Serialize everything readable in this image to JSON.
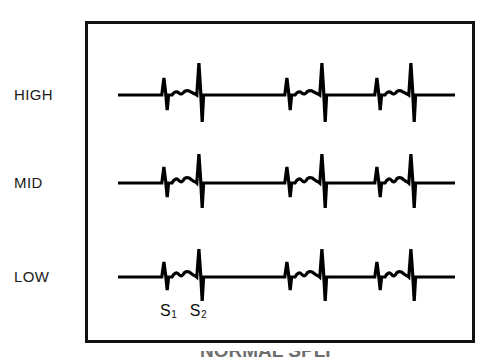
{
  "figure": {
    "background_color": "#ffffff",
    "frame": {
      "border_color": "#111111",
      "border_width_px": 3,
      "x": 85,
      "y": 21,
      "width": 390,
      "height": 322
    },
    "row_labels": [
      {
        "id": "high",
        "label": "HIGH",
        "baseline_y": 95
      },
      {
        "id": "mid",
        "label": "MID",
        "baseline_y": 183
      },
      {
        "id": "low",
        "label": "LOW",
        "baseline_y": 277
      }
    ],
    "annotations": {
      "s1": "S",
      "s1_sub": "1",
      "s2": "S",
      "s2_sub": "2"
    },
    "caption_partial": "NORMAL SPLI"
  },
  "chart_data": {
    "type": "line",
    "title": "",
    "subtitle": "",
    "xlabel": "",
    "ylabel": "",
    "grid": false,
    "legend": null,
    "stroke_color": "#000000",
    "stroke_width": 3.2,
    "trace_x_start": 118,
    "trace_x_end": 455,
    "cycle_period_px": 123,
    "series": [
      {
        "name": "HIGH",
        "baseline_y": 95,
        "cycles": 3,
        "events": [
          {
            "name": "S1",
            "x": 165,
            "up_amplitude": 17,
            "down_amplitude": 15
          },
          {
            "name": "murmur",
            "x_start": 172,
            "x_end": 196,
            "amplitude": 4
          },
          {
            "name": "S2",
            "x": 200,
            "up_amplitude": 32,
            "down_amplitude": 27
          },
          {
            "name": "S1",
            "x": 288,
            "up_amplitude": 17,
            "down_amplitude": 15
          },
          {
            "name": "murmur",
            "x_start": 295,
            "x_end": 319,
            "amplitude": 4
          },
          {
            "name": "S2",
            "x": 323,
            "up_amplitude": 32,
            "down_amplitude": 27
          },
          {
            "name": "S1",
            "x": 378,
            "up_amplitude": 17,
            "down_amplitude": 15
          },
          {
            "name": "murmur",
            "x_start": 385,
            "x_end": 408,
            "amplitude": 4
          },
          {
            "name": "S2",
            "x": 412,
            "up_amplitude": 32,
            "down_amplitude": 27
          }
        ]
      },
      {
        "name": "MID",
        "baseline_y": 183,
        "cycles": 3,
        "events": [
          {
            "name": "S1",
            "x": 165,
            "up_amplitude": 16,
            "down_amplitude": 14
          },
          {
            "name": "murmur",
            "x_start": 172,
            "x_end": 196,
            "amplitude": 5
          },
          {
            "name": "S2",
            "x": 200,
            "up_amplitude": 29,
            "down_amplitude": 25
          },
          {
            "name": "S1",
            "x": 288,
            "up_amplitude": 16,
            "down_amplitude": 14
          },
          {
            "name": "murmur",
            "x_start": 295,
            "x_end": 319,
            "amplitude": 5
          },
          {
            "name": "S2",
            "x": 323,
            "up_amplitude": 29,
            "down_amplitude": 25
          },
          {
            "name": "S1",
            "x": 378,
            "up_amplitude": 16,
            "down_amplitude": 14
          },
          {
            "name": "murmur",
            "x_start": 385,
            "x_end": 408,
            "amplitude": 5
          },
          {
            "name": "S2",
            "x": 412,
            "up_amplitude": 29,
            "down_amplitude": 25
          }
        ]
      },
      {
        "name": "LOW",
        "baseline_y": 277,
        "cycles": 3,
        "events": [
          {
            "name": "S1",
            "x": 165,
            "up_amplitude": 15,
            "down_amplitude": 13
          },
          {
            "name": "murmur",
            "x_start": 172,
            "x_end": 196,
            "amplitude": 5
          },
          {
            "name": "S2",
            "x": 200,
            "up_amplitude": 28,
            "down_amplitude": 24
          },
          {
            "name": "S1",
            "x": 288,
            "up_amplitude": 15,
            "down_amplitude": 13
          },
          {
            "name": "murmur",
            "x_start": 295,
            "x_end": 319,
            "amplitude": 5
          },
          {
            "name": "S2",
            "x": 323,
            "up_amplitude": 28,
            "down_amplitude": 24
          },
          {
            "name": "S1",
            "x": 378,
            "up_amplitude": 15,
            "down_amplitude": 13
          },
          {
            "name": "murmur",
            "x_start": 385,
            "x_end": 408,
            "amplitude": 5
          },
          {
            "name": "S2",
            "x": 412,
            "up_amplitude": 28,
            "down_amplitude": 24
          }
        ]
      }
    ]
  }
}
